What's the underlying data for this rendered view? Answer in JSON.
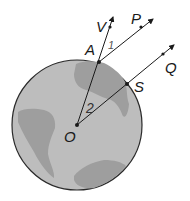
{
  "diagram": {
    "type": "geometry-globe",
    "colors": {
      "globe_fill": "#bdbdbd",
      "land_fill": "#9e9e9e",
      "outline": "#2a2a2a",
      "line": "#1a1a1a"
    },
    "points": {
      "V": "V",
      "P": "P",
      "A": "A",
      "Q": "Q",
      "S": "S",
      "O": "O"
    },
    "angles": {
      "angle1": "1",
      "angle2": "2"
    }
  }
}
